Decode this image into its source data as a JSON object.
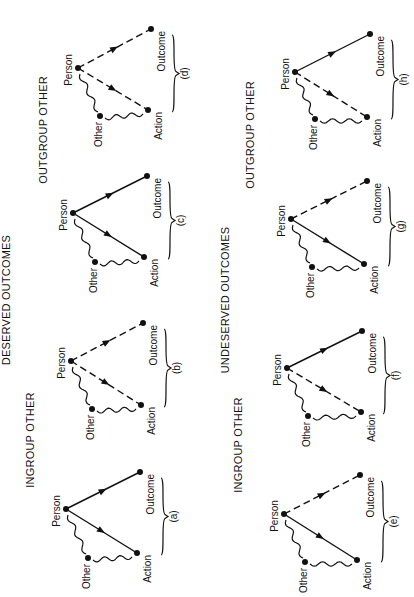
{
  "headings": {
    "deserved": "DESERVED  OUTCOMES",
    "undeserved": "UNDESERVED  OUTCOMES",
    "ingroup_top": "INGROUP  OTHER",
    "outgroup_top": "OUTGROUP  OTHER",
    "ingroup_bottom": "INGROUP  OTHER",
    "outgroup_bottom": "OUTGROUP  OTHER"
  },
  "node_labels": {
    "person": "Person",
    "outcome": "Outcome",
    "action": "Action",
    "other": "Other"
  },
  "panels": [
    {
      "id": "a",
      "label": "(a)",
      "section": "deserved",
      "group": "ingroup",
      "person_outcome": "solid",
      "person_action": "solid"
    },
    {
      "id": "b",
      "label": "(b)",
      "section": "deserved",
      "group": "ingroup",
      "person_outcome": "dashed",
      "person_action": "dashed"
    },
    {
      "id": "c",
      "label": "(c)",
      "section": "deserved",
      "group": "outgroup",
      "person_outcome": "solid",
      "person_action": "solid"
    },
    {
      "id": "d",
      "label": "(d)",
      "section": "deserved",
      "group": "outgroup",
      "person_outcome": "dashed",
      "person_action": "dashed"
    },
    {
      "id": "e",
      "label": "(e)",
      "section": "undeserved",
      "group": "ingroup",
      "person_outcome": "dashed",
      "person_action": "solid"
    },
    {
      "id": "f",
      "label": "(f)",
      "section": "undeserved",
      "group": "ingroup",
      "person_outcome": "solid",
      "person_action": "dashed"
    },
    {
      "id": "g",
      "label": "(g)",
      "section": "undeserved",
      "group": "outgroup",
      "person_outcome": "dashed",
      "person_action": "solid"
    },
    {
      "id": "h",
      "label": "(h)",
      "section": "undeserved",
      "group": "outgroup",
      "person_outcome": "solid",
      "person_action": "dashed"
    }
  ]
}
